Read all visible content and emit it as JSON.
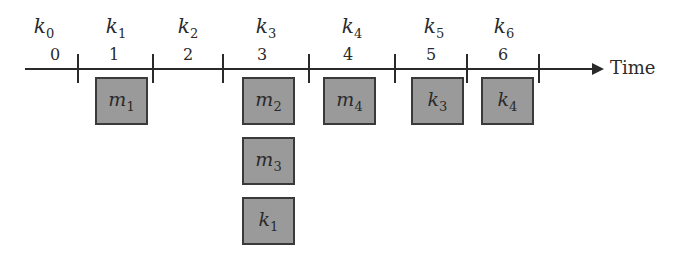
{
  "diagram": {
    "axis_label": "Time",
    "keys": [
      {
        "base": "k",
        "sub": "0",
        "x": 44
      },
      {
        "base": "k",
        "sub": "1",
        "x": 116
      },
      {
        "base": "k",
        "sub": "2",
        "x": 188
      },
      {
        "base": "k",
        "sub": "3",
        "x": 266
      },
      {
        "base": "k",
        "sub": "4",
        "x": 352
      },
      {
        "base": "k",
        "sub": "5",
        "x": 434
      },
      {
        "base": "k",
        "sub": "6",
        "x": 504
      }
    ],
    "slots": [
      {
        "label": "0",
        "x": 55
      },
      {
        "label": "1",
        "x": 114
      },
      {
        "label": "2",
        "x": 188
      },
      {
        "label": "3",
        "x": 262
      },
      {
        "label": "4",
        "x": 348
      },
      {
        "label": "5",
        "x": 431
      },
      {
        "label": "6",
        "x": 503
      }
    ],
    "ticks": [
      78,
      153,
      223,
      309,
      395,
      467,
      539
    ],
    "boxes": [
      {
        "base": "m",
        "sub": "1",
        "slot": "1",
        "x": 95,
        "y": 77
      },
      {
        "base": "m",
        "sub": "2",
        "slot": "3",
        "x": 242,
        "y": 77
      },
      {
        "base": "m",
        "sub": "3",
        "slot": "3",
        "x": 242,
        "y": 137
      },
      {
        "base": "k",
        "sub": "1",
        "slot": "3",
        "x": 242,
        "y": 197
      },
      {
        "base": "m",
        "sub": "4",
        "slot": "4",
        "x": 323,
        "y": 77
      },
      {
        "base": "k",
        "sub": "3",
        "slot": "5",
        "x": 411,
        "y": 77
      },
      {
        "base": "k",
        "sub": "4",
        "slot": "6",
        "x": 481,
        "y": 77
      }
    ]
  }
}
